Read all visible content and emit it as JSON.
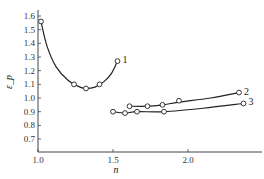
{
  "chart_data": {
    "type": "line",
    "title": "",
    "xlabel": "n",
    "ylabel": "ε_p",
    "xlim": [
      1.0,
      2.45
    ],
    "ylim": [
      0.6,
      1.65
    ],
    "xticks": [
      1.0,
      1.5,
      2.0
    ],
    "xtick_labels": [
      "1.0",
      "1.5",
      "2.0"
    ],
    "yticks": [
      0.7,
      0.8,
      0.9,
      1.0,
      1.1,
      1.2,
      1.3,
      1.4,
      1.5,
      1.6
    ],
    "ytick_labels": [
      "0.7",
      "0.8",
      "0.9",
      "1.0",
      "1.1",
      "1.2",
      "1.3",
      "1.4",
      "1.5",
      "1.6"
    ],
    "grid": false,
    "legend": "inline curve labels at line ends",
    "series": [
      {
        "name": "1",
        "points": [
          [
            1.02,
            1.56
          ],
          [
            1.24,
            1.1
          ],
          [
            1.32,
            1.07
          ],
          [
            1.41,
            1.1
          ],
          [
            1.53,
            1.27
          ]
        ],
        "curve": [
          [
            1.02,
            1.56
          ],
          [
            1.06,
            1.38
          ],
          [
            1.12,
            1.23
          ],
          [
            1.2,
            1.13
          ],
          [
            1.28,
            1.08
          ],
          [
            1.32,
            1.07
          ],
          [
            1.38,
            1.08
          ],
          [
            1.44,
            1.12
          ],
          [
            1.49,
            1.18
          ],
          [
            1.53,
            1.27
          ]
        ]
      },
      {
        "name": "2",
        "points": [
          [
            1.61,
            0.94
          ],
          [
            1.73,
            0.94
          ],
          [
            1.83,
            0.95
          ],
          [
            1.94,
            0.98
          ],
          [
            2.34,
            1.04
          ]
        ],
        "curve": [
          [
            1.61,
            0.94
          ],
          [
            1.73,
            0.94
          ],
          [
            1.83,
            0.95
          ],
          [
            1.94,
            0.97
          ],
          [
            2.15,
            1.0
          ],
          [
            2.34,
            1.04
          ]
        ]
      },
      {
        "name": "3",
        "points": [
          [
            1.5,
            0.9
          ],
          [
            1.58,
            0.89
          ],
          [
            1.66,
            0.9
          ],
          [
            1.84,
            0.9
          ],
          [
            2.37,
            0.96
          ]
        ],
        "curve": [
          [
            1.5,
            0.9
          ],
          [
            1.58,
            0.89
          ],
          [
            1.66,
            0.9
          ],
          [
            1.84,
            0.9
          ],
          [
            2.1,
            0.925
          ],
          [
            2.37,
            0.96
          ]
        ]
      }
    ]
  }
}
